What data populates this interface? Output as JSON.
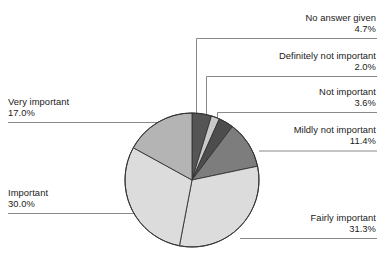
{
  "chart_data": {
    "type": "pie",
    "title": "",
    "subtitle": "",
    "xlabel": "",
    "ylabel": "",
    "legend_position": "callout-labels",
    "grid": false,
    "total_percent": 100.0,
    "start_angle_deg": 0,
    "direction": "clockwise",
    "categories": [
      "No answer given",
      "Definitely not important",
      "Not important",
      "Mildly not important",
      "Fairly important",
      "Important",
      "Very important"
    ],
    "values": [
      4.7,
      2.0,
      3.6,
      11.4,
      31.3,
      30.0,
      17.0
    ],
    "value_labels": [
      "4.7%",
      "2.0%",
      "3.6%",
      "11.4%",
      "31.3%",
      "30.0%",
      "17.0%"
    ],
    "colors": [
      "#555555",
      "#c9c9c9",
      "#4d4d4d",
      "#7d7d7d",
      "#dcdcdc",
      "#dcdcdc",
      "#b4b4b4"
    ],
    "slices": [
      {
        "label": "No answer given",
        "percent_text": "4.7%",
        "value": 4.7,
        "color": "#555555"
      },
      {
        "label": "Definitely not important",
        "percent_text": "2.0%",
        "value": 2.0,
        "color": "#c9c9c9"
      },
      {
        "label": "Not important",
        "percent_text": "3.6%",
        "value": 3.6,
        "color": "#4d4d4d"
      },
      {
        "label": "Mildly not important",
        "percent_text": "11.4%",
        "value": 11.4,
        "color": "#7d7d7d"
      },
      {
        "label": "Fairly important",
        "percent_text": "31.3%",
        "value": 31.3,
        "color": "#dcdcdc"
      },
      {
        "label": "Important",
        "percent_text": "30.0%",
        "value": 30.0,
        "color": "#dcdcdc"
      },
      {
        "label": "Very important",
        "percent_text": "17.0%",
        "value": 17.0,
        "color": "#b4b4b4"
      }
    ]
  },
  "callouts": {
    "no_answer_given": {
      "name": "No answer given",
      "pct": "4.7%"
    },
    "definitely_not_important": {
      "name": "Definitely not important",
      "pct": "2.0%"
    },
    "not_important": {
      "name": "Not important",
      "pct": "3.6%"
    },
    "mildly_not_important": {
      "name": "Mildly not important",
      "pct": "11.4%"
    },
    "fairly_important": {
      "name": "Fairly important",
      "pct": "31.3%"
    },
    "important": {
      "name": "Important",
      "pct": "30.0%"
    },
    "very_important": {
      "name": "Very important",
      "pct": "17.0%"
    }
  },
  "style": {
    "outline_color": "#333333",
    "leader_color": "#6b6b6b",
    "text_color": "#1a1a1a",
    "background": "#ffffff"
  }
}
